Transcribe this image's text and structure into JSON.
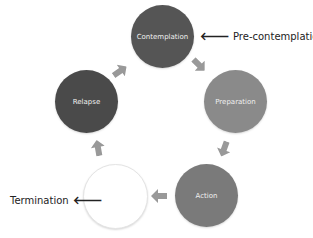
{
  "diagram": {
    "type": "cycle",
    "stages": [
      {
        "id": "contemplation",
        "label": "Contemplation",
        "color": "#555555"
      },
      {
        "id": "preparation",
        "label": "Preparation",
        "color": "#8a8a8a"
      },
      {
        "id": "action",
        "label": "Action",
        "color": "#7a7a7a"
      },
      {
        "id": "termination",
        "label": "",
        "color": "#ffffff"
      },
      {
        "id": "relapse",
        "label": "Relapse",
        "color": "#4a4a4a"
      }
    ],
    "external_labels": {
      "pre_contemplation": {
        "text": "Pre-contemplation",
        "arrow": "🡐"
      },
      "termination": {
        "text": "Termination",
        "arrow": "🡐"
      }
    },
    "arrow_color": "#999999"
  }
}
